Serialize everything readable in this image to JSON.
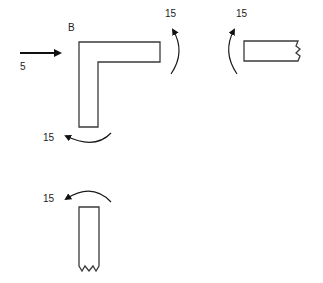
{
  "diagram": {
    "point_label": "B",
    "force": {
      "value": "5",
      "direction": "right"
    },
    "moments": [
      {
        "id": "right-of-L",
        "value": "15",
        "direction": "counterclockwise"
      },
      {
        "id": "right-segment",
        "value": "15",
        "direction": "clockwise"
      },
      {
        "id": "below-L",
        "value": "15",
        "direction": "clockwise"
      },
      {
        "id": "bottom-segment",
        "value": "15",
        "direction": "counterclockwise"
      }
    ],
    "parts": [
      "L-shaped member",
      "horizontal cut segment",
      "vertical cut segment"
    ],
    "colors": {
      "stroke": "#3a3a3a",
      "text": "#222222",
      "background": "#ffffff"
    }
  }
}
